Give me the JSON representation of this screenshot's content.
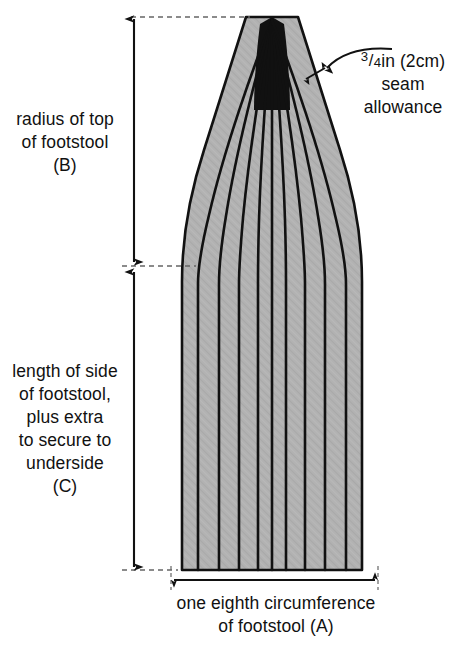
{
  "figure": {
    "name": "footstool-cover-panel-pattern",
    "background_color": "#ffffff",
    "fill_color": "#b0b0b0",
    "line_color": "#111111",
    "panel_count": 10,
    "interior_seam_line_count": 9
  },
  "labels": {
    "radius_top": {
      "line1": "radius of top",
      "line2": "of footstool",
      "line3": "(B)"
    },
    "length_side": {
      "line1": "length of side",
      "line2": "of footstool,",
      "line3": "plus extra",
      "line4": "to secure to",
      "line5": "underside",
      "line6": "(C)"
    },
    "seam_allowance": {
      "measure_numerator": "3",
      "measure_slash": "/",
      "measure_denominator": "4",
      "measure_unit": "in (2cm)",
      "line2": "seam",
      "line3": "allowance"
    },
    "circumference": {
      "line1": "one eighth circumference",
      "line2": "of footstool (A)"
    }
  },
  "dimensions": {
    "vertical_top": {
      "id": "B",
      "description": "radius of top of footstool"
    },
    "vertical_bottom": {
      "id": "C",
      "description": "length of side of footstool plus extra to secure to underside"
    },
    "horizontal_bottom": {
      "id": "A",
      "description": "one eighth circumference of footstool"
    },
    "seam": {
      "id": "seam",
      "description": "3/4in (2cm) seam allowance"
    }
  }
}
